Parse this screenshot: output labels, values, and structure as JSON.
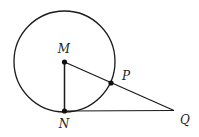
{
  "diagram": {
    "type": "geometry",
    "colors": {
      "stroke": "#1a1a1a",
      "background": "#ffffff"
    },
    "circle": {
      "center": "M",
      "cx": 64.5,
      "cy": 61.5,
      "r": 50.5
    },
    "points": [
      {
        "id": "M",
        "label": "M",
        "x": 64.5,
        "y": 62,
        "label_x": 64,
        "label_y": 53
      },
      {
        "id": "N",
        "label": "N",
        "x": 64.5,
        "y": 111,
        "label_x": 64,
        "label_y": 128
      },
      {
        "id": "P",
        "label": "P",
        "x": 111,
        "y": 83,
        "label_x": 126,
        "label_y": 80
      },
      {
        "id": "Q",
        "label": "Q",
        "x": 174,
        "y": 110.5,
        "label_x": 185,
        "label_y": 124
      }
    ],
    "segments": [
      {
        "from": "M",
        "to": "N"
      },
      {
        "from": "M",
        "to": "Q"
      },
      {
        "from": "N",
        "to": "Q"
      }
    ]
  }
}
